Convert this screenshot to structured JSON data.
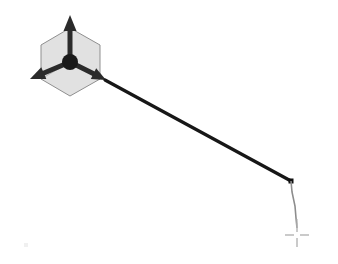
{
  "viewport": {
    "label": "3d-viewport",
    "width": 338,
    "height": 264,
    "background_color": "#ffffff"
  },
  "gizmo": {
    "label": "Move / Translate Gizmo",
    "origin": {
      "x": 70,
      "y": 62
    },
    "hub_color": "#1a1a1a",
    "hub_radius": 8,
    "cube": {
      "label": "Isometric Bounding Cube",
      "fill_color": "#c9c9c9",
      "stroke_color": "#8f8f8f",
      "opacity": 0.55,
      "points": "70,28 100,45 100,79 70,96 41,79 41,45"
    },
    "axes": [
      {
        "name": "y-axis-up",
        "label": "Y",
        "color": "#2b2b2b",
        "from": {
          "x": 70,
          "y": 62
        },
        "to": {
          "x": 70,
          "y": 15
        },
        "shaft_width": 5,
        "head_length": 16,
        "head_width": 13
      },
      {
        "name": "x-axis-left",
        "label": "X",
        "color": "#2b2b2b",
        "from": {
          "x": 70,
          "y": 62
        },
        "to": {
          "x": 30,
          "y": 79
        },
        "shaft_width": 5,
        "head_length": 15,
        "head_width": 13
      },
      {
        "name": "z-axis-right",
        "label": "Z",
        "color": "#2b2b2b",
        "from": {
          "x": 70,
          "y": 62
        },
        "to": {
          "x": 106,
          "y": 80
        },
        "shaft_width": 5,
        "head_length": 14,
        "head_width": 12
      }
    ]
  },
  "geometry": {
    "label": "Drawn Polyline",
    "primary_edge": {
      "name": "main-edge",
      "color": "#171717",
      "stroke_width": 3.2,
      "from": {
        "x": 105,
        "y": 80
      },
      "to": {
        "x": 291,
        "y": 181
      }
    },
    "vertex": {
      "name": "edge-vertex",
      "color": "#111111",
      "x": 291,
      "y": 181,
      "size": 5
    },
    "rubber_band": {
      "name": "rubber-band-segment",
      "color": "#8d8d8d",
      "stroke_width": 1.6,
      "points": "291,181 292,192 295,206 296,218 297,228"
    }
  },
  "cursor": {
    "label": "Crosshair Cursor",
    "x": 297,
    "y": 235,
    "arm_length": 9,
    "gap": 3,
    "color": "#b4b4b4",
    "stroke_width": 1.4,
    "stem_top": 219
  },
  "artifacts": {
    "speck_label": "scan-artifact-speck"
  }
}
